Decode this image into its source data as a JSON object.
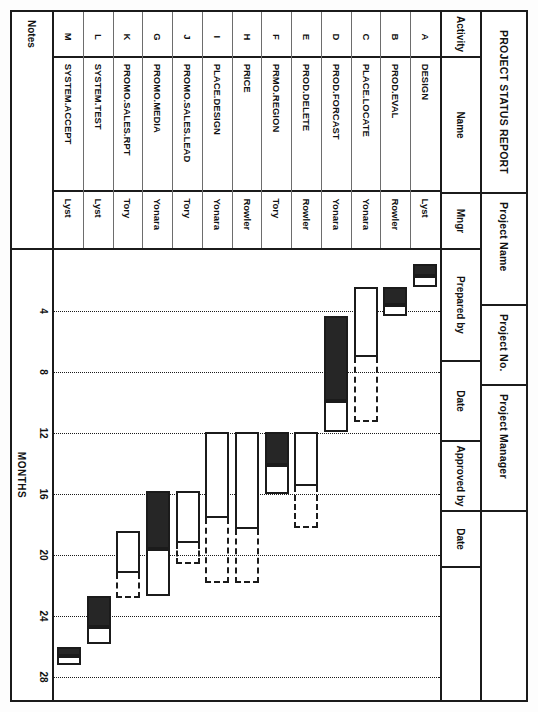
{
  "report": {
    "title": "PROJECT STATUS REPORT",
    "project_name_label": "Project Name",
    "project_no_label": "Project No.",
    "project_manager_label": "Project Manager",
    "project_name_value": "",
    "project_no_value": "",
    "project_manager_value": ""
  },
  "columns": {
    "activity": "Activity",
    "name": "Name",
    "mngr": "Mngr",
    "prepared_by": "Prepared by",
    "date1": "Date",
    "approved_by": "Approved by",
    "date2": "Date"
  },
  "notes": {
    "label": "Notes",
    "value": ""
  },
  "axis": {
    "label": "MONTHS",
    "ticks": [
      4,
      8,
      12,
      16,
      20,
      24,
      28
    ],
    "min": 0,
    "max": 29.5
  },
  "legend": {
    "solid_meaning": "completed / actual",
    "hollow_meaning": "remaining / planned",
    "dashed_meaning": "float"
  },
  "rows": [
    {
      "activity": "A",
      "name": "DESIGN",
      "mngr": "Lyst",
      "start": 0.9,
      "solid_end": 1.7,
      "end": 2.4,
      "float_end": null
    },
    {
      "activity": "B",
      "name": "PROD.EVAL",
      "mngr": "Rowler",
      "start": 2.4,
      "solid_end": 3.6,
      "end": 4.3,
      "float_end": null
    },
    {
      "activity": "C",
      "name": "PLACE.LOCATE",
      "mngr": "Yonara",
      "start": 2.4,
      "solid_end": 2.4,
      "end": 7.0,
      "float_end": 11.3
    },
    {
      "activity": "D",
      "name": "PROD.FORCAST",
      "mngr": "Yonara",
      "start": 4.3,
      "solid_end": 9.9,
      "end": 11.9,
      "float_end": null
    },
    {
      "activity": "E",
      "name": "PROD.DELETE",
      "mngr": "Rowler",
      "start": 11.9,
      "solid_end": 11.9,
      "end": 15.5,
      "float_end": 18.2
    },
    {
      "activity": "F",
      "name": "PRMO.REGION",
      "mngr": "Tory",
      "start": 11.9,
      "solid_end": 14.1,
      "end": 16.0,
      "float_end": null
    },
    {
      "activity": "H",
      "name": "PRICE",
      "mngr": "Rowler",
      "start": 11.9,
      "solid_end": 11.9,
      "end": 18.3,
      "float_end": 21.8
    },
    {
      "activity": "I",
      "name": "PLACE.DESIGN",
      "mngr": "Yonara",
      "start": 11.9,
      "solid_end": 11.9,
      "end": 17.6,
      "float_end": 21.8
    },
    {
      "activity": "J",
      "name": "PROMO.SALES.LEAD",
      "mngr": "Tory",
      "start": 15.8,
      "solid_end": 15.8,
      "end": 19.2,
      "float_end": 20.6
    },
    {
      "activity": "G",
      "name": "PROMO.MEDIA",
      "mngr": "Yonara",
      "start": 15.8,
      "solid_end": 19.6,
      "end": 22.7,
      "float_end": null
    },
    {
      "activity": "K",
      "name": "PROMO.SALES.RPT",
      "mngr": "Tory",
      "start": 18.4,
      "solid_end": 18.4,
      "end": 21.2,
      "float_end": 22.8
    },
    {
      "activity": "L",
      "name": "SYSTEM.TEST",
      "mngr": "Lyst",
      "start": 22.7,
      "solid_end": 24.7,
      "end": 25.8,
      "float_end": null
    },
    {
      "activity": "M",
      "name": "SYSTEM.ACCEPT",
      "mngr": "Lyst",
      "start": 26.0,
      "solid_end": 26.6,
      "end": 27.2,
      "float_end": null
    }
  ]
}
